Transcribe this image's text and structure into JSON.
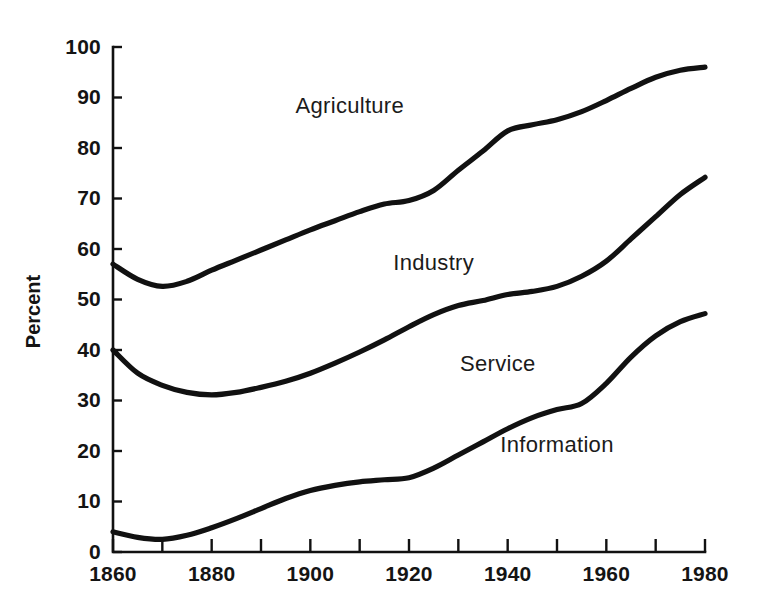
{
  "chart_data": {
    "type": "line",
    "title": "",
    "subtitle": "",
    "xlabel": "",
    "ylabel": "Percent",
    "xlim": [
      1860,
      1980
    ],
    "ylim": [
      0,
      100
    ],
    "grid": false,
    "legend_position": "inline-annotations",
    "x_ticks": [
      1860,
      1880,
      1900,
      1920,
      1940,
      1960,
      1980
    ],
    "x_tick_labels": [
      "1860",
      "1880",
      "1900",
      "1920",
      "1940",
      "1960",
      "1980"
    ],
    "x_minor_ticks": [
      1870,
      1890,
      1910,
      1930,
      1950,
      1970
    ],
    "y_ticks": [
      0,
      10,
      20,
      30,
      40,
      50,
      60,
      70,
      80,
      90,
      100
    ],
    "y_tick_labels": [
      "0",
      "10",
      "20",
      "30",
      "40",
      "50",
      "60",
      "70",
      "80",
      "90",
      "100"
    ],
    "annotations": [
      {
        "text": "Agriculture",
        "x": 1908,
        "y": 88
      },
      {
        "text": "Industry",
        "x": 1925,
        "y": 57
      },
      {
        "text": "Service",
        "x": 1938,
        "y": 37
      },
      {
        "text": "Information",
        "x": 1950,
        "y": 21
      }
    ],
    "x": [
      1860,
      1865,
      1870,
      1875,
      1880,
      1885,
      1890,
      1895,
      1900,
      1905,
      1910,
      1915,
      1920,
      1925,
      1930,
      1935,
      1940,
      1945,
      1950,
      1955,
      1960,
      1965,
      1970,
      1975,
      1980
    ],
    "series": [
      {
        "name": "Agriculture",
        "description": "Upper cumulative boundary curve",
        "values": [
          57.0,
          54.0,
          52.6,
          53.6,
          55.8,
          57.8,
          59.8,
          61.8,
          63.8,
          65.6,
          67.4,
          68.9,
          69.6,
          71.6,
          75.6,
          79.4,
          83.4,
          84.6,
          85.6,
          87.2,
          89.4,
          91.8,
          94.0,
          95.4,
          96.0
        ]
      },
      {
        "name": "Industry",
        "description": "Middle cumulative boundary curve",
        "values": [
          40.0,
          35.4,
          33.0,
          31.6,
          31.1,
          31.6,
          32.6,
          33.8,
          35.4,
          37.4,
          39.6,
          42.0,
          44.6,
          47.0,
          48.8,
          49.8,
          51.0,
          51.6,
          52.6,
          54.6,
          57.6,
          62.0,
          66.4,
          70.8,
          74.2
        ]
      },
      {
        "name": "Service",
        "description": "Lower cumulative boundary curve",
        "values": [
          4.0,
          2.9,
          2.5,
          3.3,
          4.8,
          6.6,
          8.6,
          10.6,
          12.2,
          13.2,
          13.9,
          14.3,
          14.7,
          16.6,
          19.2,
          21.8,
          24.4,
          26.6,
          28.2,
          29.4,
          33.4,
          38.6,
          42.8,
          45.6,
          47.2
        ]
      }
    ]
  },
  "axes": {
    "y_axis_title": "Percent"
  }
}
